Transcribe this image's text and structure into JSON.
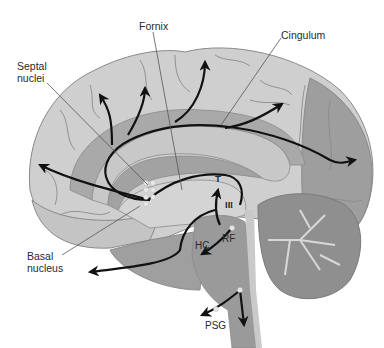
{
  "diagram": {
    "type": "anatomical-sagittal-brain",
    "colors": {
      "background": "#ffffff",
      "cortex_light": "#cfcfcf",
      "cortex_mid": "#b9b9b9",
      "occipital_dark": "#9e9e9e",
      "limbic_band": "#a9a9a9",
      "corpus_callosum": "#c8c8c8",
      "ventricle": "#a2a2a2",
      "brainstem": "#9a9a9a",
      "cerebellum": "#8f8f8f",
      "arbor_vitae": "#d8d8d8",
      "sulcus_line": "#8a8a8a",
      "pathway_arrow": "#111111",
      "leader_line": "#555555",
      "nucleus_dot": "#e8e8e8"
    },
    "labels": {
      "fornix": "Fornix",
      "cingulum": "Cingulum",
      "septal_nuclei": "Septal\nnuclei",
      "basal_nucleus": "Basal\nnucleus",
      "thalamus": "T",
      "third_ventricle": "III",
      "habenula_complex": "HC",
      "reticular_formation": "RF",
      "psg": "PSG"
    }
  }
}
